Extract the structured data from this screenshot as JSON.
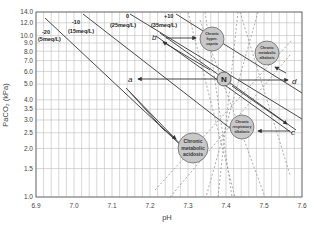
{
  "chart_data": {
    "type": "line",
    "title": "",
    "xlabel": "pH",
    "ylabel": "PaCO2 (kPa)",
    "xlim": [
      6.9,
      7.6
    ],
    "ylim": [
      1.0,
      14.0
    ],
    "yscale": "log",
    "grid": true,
    "x_ticks": [
      "6.9",
      "7.0",
      "7.1",
      "7.2",
      "7.3",
      "7.4",
      "7.5",
      "7.6"
    ],
    "y_ticks": [
      "1.0",
      "1.5",
      "2.0",
      "2.5",
      "3.0",
      "3.5",
      "4.0",
      "5.0",
      "6.0",
      "7.0",
      "8.0",
      "9.0",
      "10.0",
      "12.0",
      "14.0"
    ],
    "series": [
      {
        "name": "-20 (5meq/L)",
        "label_top": "-20",
        "label_bottom": "(5meq/L)",
        "points": [
          [
            6.95,
            13.0
          ],
          [
            7.34,
            1.9
          ]
        ]
      },
      {
        "name": "-10 (15meq/L)",
        "label_top": "-10",
        "label_bottom": "(15meq/L)",
        "points": [
          [
            7.13,
            13.5
          ],
          [
            7.58,
            3.3
          ]
        ]
      },
      {
        "name": "0 (25meq/L)",
        "label_top": "0",
        "label_bottom": "(25meq/L)",
        "points": [
          [
            7.28,
            13.5
          ],
          [
            7.6,
            4.6
          ]
        ]
      },
      {
        "name": "+10 (35meq/L)",
        "label_top": "+10",
        "label_bottom": "(35meq/L)",
        "points": [
          [
            7.38,
            13.5
          ],
          [
            7.6,
            6.5
          ]
        ]
      }
    ],
    "normal_point": {
      "label": "N",
      "ph": 7.4,
      "paco2": 5.3
    },
    "annotations": [
      {
        "label": "a",
        "ph": 7.12,
        "paco2": 5.3,
        "direction": "N to a"
      },
      {
        "label": "b",
        "ph": 7.23,
        "paco2": 9.8,
        "direction": "along base excess line toward higher PaCO2"
      },
      {
        "label": "c",
        "ph": 7.57,
        "paco2": 2.4,
        "direction": "toward lower PaCO2"
      },
      {
        "label": "d",
        "ph": 7.59,
        "paco2": 5.3,
        "direction": "N to d"
      }
    ],
    "regions": [
      {
        "label": "Chronic hypercapnia",
        "ph": 7.38,
        "paco2": 9.7
      },
      {
        "label": "Chronic metabolic alkalosis",
        "ph": 7.52,
        "paco2": 7.6
      },
      {
        "label": "Chronic respiratory alkalosis",
        "ph": 7.46,
        "paco2": 3.0
      },
      {
        "label": "Chronic metabolic acidosis",
        "ph": 7.33,
        "paco2": 2.1
      }
    ]
  },
  "labels": {
    "xlabel": "pH",
    "ylabel": "PaCO₂ (kPa)",
    "normal": "N",
    "a": "a",
    "b": "b",
    "c": "c",
    "d": "d",
    "be_m20_top": "-20",
    "be_m20_bot": "(5meq/L)",
    "be_m10_top": "-10",
    "be_m10_bot": "(15meq/L)",
    "be_0_top": "0",
    "be_0_bot": "(25meq/L)",
    "be_p10_top": "+10",
    "be_p10_bot": "(35meq/L)",
    "hypercapnia_1": "Chronic",
    "hypercapnia_2": "hyper-",
    "hypercapnia_3": "capnia",
    "metalk_1": "Chronic",
    "metalk_2": "metabolic",
    "metalk_3": "alkalosis",
    "respalk_1": "Chronic",
    "respalk_2": "respiratory",
    "respalk_3": "alkalosis",
    "metacid_1": "Chronic",
    "metacid_2": "metabolic",
    "metacid_3": "acidosis"
  },
  "colors": {
    "grid": "#b8b8b8",
    "line": "#4a4a4a",
    "bubble_fill": "#c8c8c8",
    "bubble_stroke": "#6a6a6a",
    "text": "#333333"
  }
}
